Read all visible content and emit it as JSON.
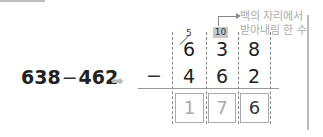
{
  "expression": {
    "minuend": "638",
    "operator": "−",
    "subtrahend": "462",
    "arrow": "➡"
  },
  "vertical_subtraction": {
    "operator": "−",
    "borrow_marks": {
      "hundreds_new": "5",
      "tens_borrowed": "10"
    },
    "top_row": [
      "6",
      "3",
      "8"
    ],
    "bottom_row": [
      "4",
      "6",
      "2"
    ],
    "result_row": [
      "1",
      "7",
      "6"
    ]
  },
  "annotation": {
    "line1": "백의 자리에서",
    "line2": "받아내림 한 수"
  },
  "colors": {
    "text": "#222222",
    "annotation": "#aaaaaa",
    "borrow_box": "#c8c8c8",
    "dashed_lines": "#888888"
  }
}
